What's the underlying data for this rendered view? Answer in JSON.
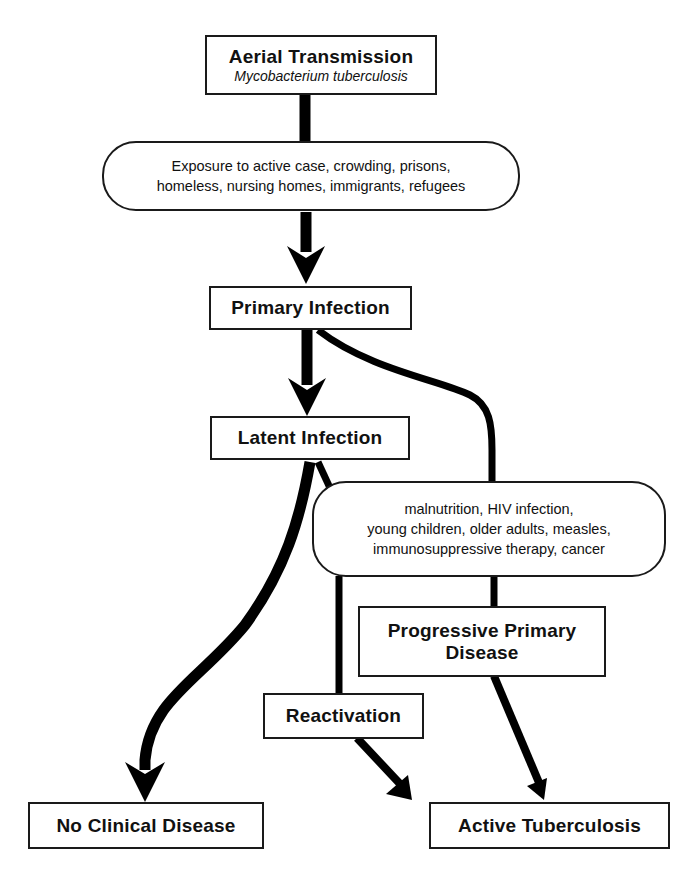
{
  "diagram": {
    "nodes": {
      "aerial": {
        "title": "Aerial Transmission",
        "subtitle": "Mycobacterium tuberculosis"
      },
      "exposure": {
        "line1": "Exposure to active case, crowding, prisons,",
        "line2": "homeless, nursing homes, immigrants, refugees"
      },
      "primary": {
        "title": "Primary Infection"
      },
      "latent": {
        "title": "Latent Infection"
      },
      "risk": {
        "line1": "malnutrition, HIV infection,",
        "line2": "young children, older adults, measles,",
        "line3": "immunosuppressive therapy, cancer"
      },
      "progressive": {
        "line1": "Progressive Primary",
        "line2": "Disease"
      },
      "reactivation": {
        "title": "Reactivation"
      },
      "no_disease": {
        "title": "No Clinical Disease"
      },
      "active_tb": {
        "title": "Active Tuberculosis"
      }
    },
    "edges": [
      {
        "from": "Aerial Transmission",
        "to": "Primary Infection",
        "via": "Exposure factors"
      },
      {
        "from": "Primary Infection",
        "to": "Latent Infection"
      },
      {
        "from": "Primary Infection",
        "to": "Progressive Primary Disease",
        "via": "Risk factors"
      },
      {
        "from": "Latent Infection",
        "to": "No Clinical Disease"
      },
      {
        "from": "Latent Infection",
        "to": "Reactivation",
        "via": "Risk factors"
      },
      {
        "from": "Reactivation",
        "to": "Active Tuberculosis"
      },
      {
        "from": "Progressive Primary Disease",
        "to": "Active Tuberculosis"
      }
    ],
    "colors": {
      "line": "#000000",
      "background": "#ffffff"
    }
  }
}
